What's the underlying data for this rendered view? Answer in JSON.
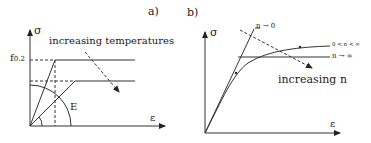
{
  "panel_a": {
    "label": "a)",
    "y_axis": "σ",
    "x_axis": "ε",
    "yield_label": "f",
    "yield_sub": "0.2",
    "modulus_label": "E",
    "annotation": "increasing temperatures"
  },
  "panel_b": {
    "label": "b)",
    "y_axis": "σ",
    "x_axis": "ε",
    "curve_n0": "n → 0",
    "curve_mid": "0 < n < ∞",
    "curve_inf": "n → ∞",
    "annotation": "increasing n"
  },
  "colors": {
    "line": "#333333",
    "background": "#ffffff"
  }
}
